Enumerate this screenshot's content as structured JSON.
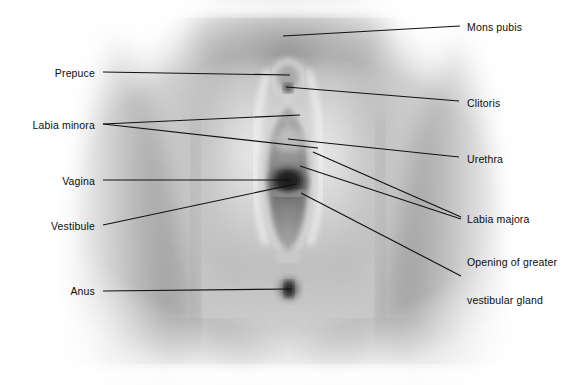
{
  "figure": {
    "width": 571,
    "height": 385,
    "background_color": "#ffffff",
    "line_color": "#111111",
    "text_color": "#0d0d0d",
    "image_type": "grayscale-photograph"
  },
  "labels": [
    {
      "id": "mons-pubis",
      "text": "Mons pubis",
      "side": "right",
      "text_x": 467,
      "text_y": 27,
      "leader": [
        [
          283,
          36
        ],
        [
          460,
          26
        ]
      ]
    },
    {
      "id": "prepuce",
      "text": "Prepuce",
      "side": "left",
      "text_x": 95,
      "text_y": 73,
      "leader": [
        [
          103,
          72
        ],
        [
          290,
          75
        ]
      ]
    },
    {
      "id": "clitoris",
      "text": "Clitoris",
      "side": "right",
      "text_x": 467,
      "text_y": 103,
      "leader": [
        [
          286,
          87
        ],
        [
          459,
          101
        ]
      ]
    },
    {
      "id": "labia-minora",
      "text": "Labia minora",
      "side": "left",
      "text_x": 95,
      "text_y": 125,
      "leader": [
        [
          103,
          124
        ],
        [
          300,
          115
        ]
      ],
      "leader2": [
        [
          103,
          124
        ],
        [
          318,
          148
        ]
      ]
    },
    {
      "id": "urethra",
      "text": "Urethra",
      "side": "right",
      "text_x": 467,
      "text_y": 159,
      "leader": [
        [
          288,
          139
        ],
        [
          459,
          157
        ]
      ]
    },
    {
      "id": "vagina",
      "text": "Vagina",
      "side": "left",
      "text_x": 95,
      "text_y": 181,
      "leader": [
        [
          103,
          180
        ],
        [
          291,
          180
        ]
      ]
    },
    {
      "id": "vestibule",
      "text": "Vestibule",
      "side": "left",
      "text_x": 95,
      "text_y": 226,
      "leader": [
        [
          103,
          225
        ],
        [
          296,
          184
        ]
      ]
    },
    {
      "id": "labia-majora",
      "text": "Labia majora",
      "side": "right",
      "text_x": 467,
      "text_y": 219,
      "leader": [
        [
          313,
          152
        ],
        [
          461,
          217
        ]
      ],
      "leader2": [
        [
          300,
          166
        ],
        [
          461,
          219
        ]
      ]
    },
    {
      "id": "opening-of-greater-vestibular-gland",
      "text": "Opening of greater\nvestibular gland",
      "line1": "Opening of greater",
      "line2": "vestibular gland",
      "side": "right",
      "text_x": 467,
      "text_y": 281,
      "leader": [
        [
          301,
          193
        ],
        [
          461,
          276
        ]
      ]
    },
    {
      "id": "anus",
      "text": "Anus",
      "side": "left",
      "text_x": 95,
      "text_y": 291,
      "leader": [
        [
          103,
          291
        ],
        [
          291,
          289
        ]
      ]
    }
  ]
}
